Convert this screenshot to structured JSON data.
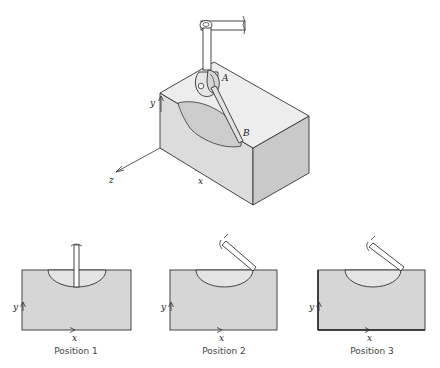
{
  "figure": {
    "type": "engineering-diagram",
    "colors": {
      "line": "#333333",
      "block_front": "#d9d9d9",
      "block_top": "#ececec",
      "block_right": "#c8c8c8",
      "cut_surface": "#cfcfcf",
      "panel_fill": "#d6d6d6",
      "cut_fill": "#e4e4e4",
      "rod_fill": "#ffffff"
    },
    "isometric_view": {
      "point_labels": {
        "a": "A",
        "b": "B"
      },
      "axis_labels": {
        "x": "x",
        "y": "y",
        "z": "z"
      }
    },
    "panels": [
      {
        "caption": "Position 1",
        "axis_x": "x",
        "axis_y": "y"
      },
      {
        "caption": "Position 2",
        "axis_x": "x",
        "axis_y": "y"
      },
      {
        "caption": "Position 3",
        "axis_x": "x",
        "axis_y": "y"
      }
    ]
  }
}
